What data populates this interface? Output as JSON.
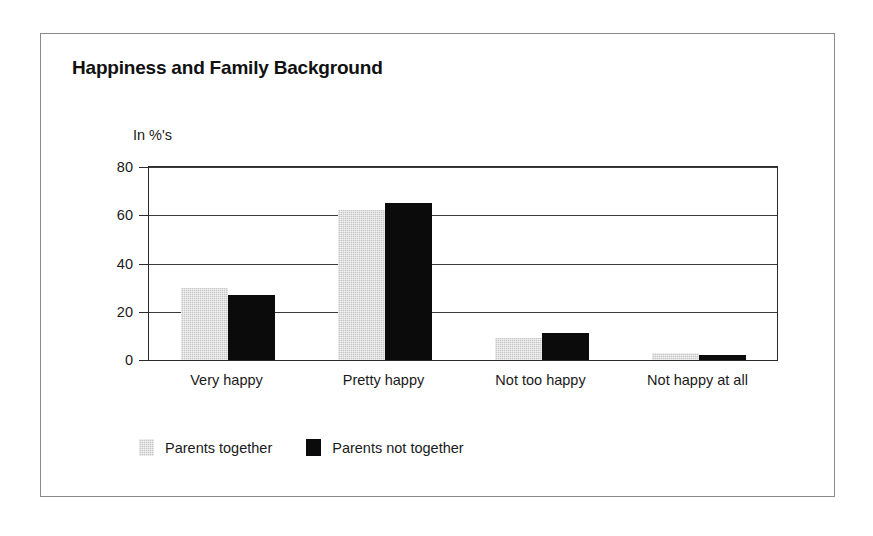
{
  "chart_data": {
    "type": "bar",
    "title": "Happiness and Family Background",
    "ylabel": "In %'s",
    "xlabel": "",
    "ylim": [
      0,
      80
    ],
    "yticks": [
      0,
      20,
      40,
      60,
      80
    ],
    "ytick_labels": [
      "0",
      "20",
      "40",
      "60",
      "80"
    ],
    "grid": true,
    "legend_position": "bottom-left",
    "categories": [
      "Very happy",
      "Pretty happy",
      "Not too happy",
      "Not happy at all"
    ],
    "series": [
      {
        "name": "Parents together",
        "color": "#c6c6c6",
        "values": [
          30,
          62,
          9,
          3
        ]
      },
      {
        "name": "Parents not together",
        "color": "#0b0b0b",
        "values": [
          27,
          65,
          11,
          2
        ]
      }
    ]
  },
  "figure": {
    "border_color": "#8a8a8a",
    "background": "#ffffff",
    "axis_color": "#2b2b2b"
  }
}
